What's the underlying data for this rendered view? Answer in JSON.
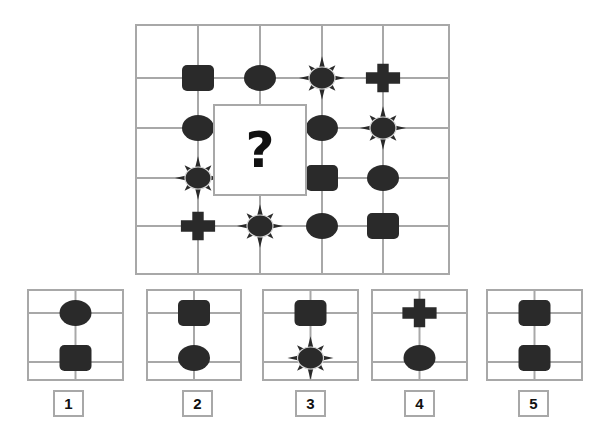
{
  "puzzle": {
    "question_mark": "?",
    "shape_color": "#2a2a2a",
    "grid_line_color": "#a8a8a8",
    "main_grid": {
      "columns": 5,
      "rows": 5,
      "shapes": [
        {
          "row": 1,
          "col": 1,
          "shape": "square"
        },
        {
          "row": 1,
          "col": 2,
          "shape": "oval"
        },
        {
          "row": 1,
          "col": 3,
          "shape": "sun"
        },
        {
          "row": 1,
          "col": 4,
          "shape": "cross"
        },
        {
          "row": 2,
          "col": 1,
          "shape": "oval"
        },
        {
          "row": 2,
          "col": 3,
          "shape": "oval"
        },
        {
          "row": 2,
          "col": 4,
          "shape": "sun"
        },
        {
          "row": 3,
          "col": 1,
          "shape": "sun"
        },
        {
          "row": 3,
          "col": 3,
          "shape": "square"
        },
        {
          "row": 3,
          "col": 4,
          "shape": "oval"
        },
        {
          "row": 4,
          "col": 1,
          "shape": "cross"
        },
        {
          "row": 4,
          "col": 2,
          "shape": "sun"
        },
        {
          "row": 4,
          "col": 3,
          "shape": "oval"
        },
        {
          "row": 4,
          "col": 4,
          "shape": "square"
        }
      ],
      "missing_region": "rows 2-3, columns 1-2 intersection area"
    },
    "options": [
      {
        "label": "1",
        "top": "oval",
        "bottom": "square"
      },
      {
        "label": "2",
        "top": "square",
        "bottom": "oval"
      },
      {
        "label": "3",
        "top": "square",
        "bottom": "sun"
      },
      {
        "label": "4",
        "top": "cross",
        "bottom": "oval"
      },
      {
        "label": "5",
        "top": "square",
        "bottom": "square"
      }
    ]
  }
}
